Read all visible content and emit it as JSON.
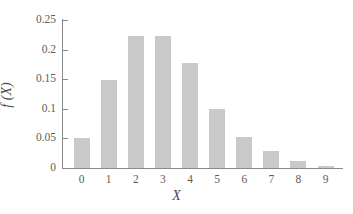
{
  "chart_data": {
    "type": "bar",
    "title": "",
    "xlabel": "X",
    "ylabel": "f (X)",
    "categories": [
      "0",
      "1",
      "2",
      "3",
      "4",
      "5",
      "6",
      "7",
      "8",
      "9"
    ],
    "values": [
      0.05,
      0.149,
      0.223,
      0.223,
      0.178,
      0.1,
      0.052,
      0.029,
      0.012,
      0.004
    ],
    "ylim": [
      0,
      0.25
    ],
    "xlim": [
      -0.5,
      9.5
    ],
    "y_ticks": [
      0,
      0.05,
      0.1,
      0.15,
      0.2,
      0.25
    ],
    "y_tick_labels": [
      "0",
      "0.05",
      "0.1",
      "0.15",
      "0.2",
      "0.25"
    ],
    "x_ticks": [
      0,
      1,
      2,
      3,
      4,
      5,
      6,
      7,
      8,
      9
    ],
    "x_tick_labels": [
      "0",
      "1",
      "2",
      "3",
      "4",
      "5",
      "6",
      "7",
      "8",
      "9"
    ],
    "grid": false,
    "legend": null,
    "legend_position": "none",
    "bar_color": "#c9c9c9",
    "axis_color": "#8a8a8a",
    "text_color": "#5d5d5d",
    "background_color": "#ffffff"
  }
}
